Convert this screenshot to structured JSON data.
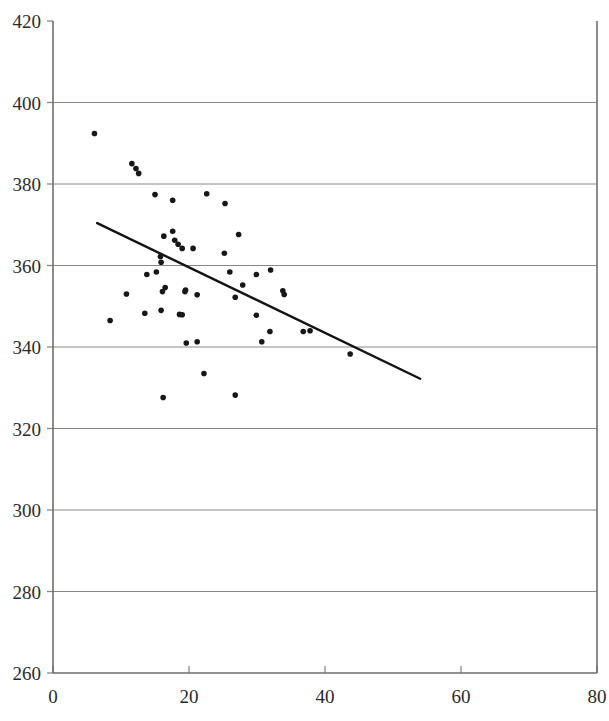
{
  "chart_data": {
    "type": "scatter",
    "title": "",
    "subtitle": "",
    "xlabel": "",
    "ylabel": "",
    "xlim": [
      0,
      80
    ],
    "ylim": [
      260,
      420
    ],
    "xticks": [
      0,
      20,
      40,
      60,
      80
    ],
    "yticks": [
      260,
      280,
      300,
      320,
      340,
      360,
      380,
      400,
      420
    ],
    "grid": "horizontal",
    "legend": "none",
    "marker": {
      "shape": "circle",
      "color": "#171717",
      "size_px": 5.6
    },
    "series": [
      {
        "name": "observations",
        "points": [
          [
            6.1,
            392.4
          ],
          [
            11.6,
            385.0
          ],
          [
            12.2,
            383.8
          ],
          [
            12.6,
            382.6
          ],
          [
            15.0,
            377.4
          ],
          [
            17.6,
            376.0
          ],
          [
            22.6,
            377.6
          ],
          [
            25.3,
            375.2
          ],
          [
            16.3,
            367.2
          ],
          [
            17.6,
            368.4
          ],
          [
            17.9,
            366.2
          ],
          [
            18.4,
            365.2
          ],
          [
            19.0,
            364.2
          ],
          [
            20.6,
            364.2
          ],
          [
            27.3,
            367.6
          ],
          [
            25.2,
            363.0
          ],
          [
            15.8,
            362.2
          ],
          [
            15.9,
            360.8
          ],
          [
            13.8,
            357.8
          ],
          [
            15.2,
            358.4
          ],
          [
            26.0,
            358.4
          ],
          [
            29.9,
            357.8
          ],
          [
            32.0,
            358.9
          ],
          [
            16.5,
            354.6
          ],
          [
            19.5,
            354.0
          ],
          [
            21.2,
            352.8
          ],
          [
            27.9,
            355.2
          ],
          [
            33.8,
            353.8
          ],
          [
            34.0,
            352.9
          ],
          [
            10.8,
            353.0
          ],
          [
            16.1,
            353.6
          ],
          [
            19.4,
            353.6
          ],
          [
            26.8,
            352.2
          ],
          [
            13.5,
            348.3
          ],
          [
            15.9,
            349.0
          ],
          [
            18.6,
            348.0
          ],
          [
            19.0,
            347.9
          ],
          [
            29.9,
            347.8
          ],
          [
            8.4,
            346.5
          ],
          [
            31.9,
            343.8
          ],
          [
            36.8,
            343.8
          ],
          [
            37.8,
            344.0
          ],
          [
            30.7,
            341.3
          ],
          [
            21.2,
            341.3
          ],
          [
            19.6,
            341.0
          ],
          [
            43.7,
            338.3
          ],
          [
            22.2,
            333.5
          ],
          [
            16.2,
            327.6
          ],
          [
            26.8,
            328.2
          ]
        ]
      }
    ],
    "trendline": {
      "name": "regression-line",
      "x0": 6.5,
      "y0": 370.4,
      "x1": 54.0,
      "y1": 332.2,
      "color": "#141414"
    }
  },
  "footer": {
    "smudge_text": ""
  }
}
